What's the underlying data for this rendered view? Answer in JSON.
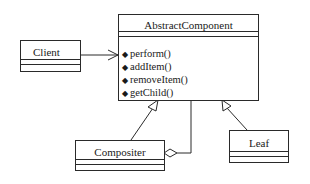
{
  "diagram": {
    "type": "UML class diagram (Composite pattern)",
    "classes": {
      "abstract_component": {
        "name": "AbstractComponent",
        "attributes": [],
        "operations": [
          {
            "bullet": "◆",
            "label": "perform()"
          },
          {
            "bullet": "◆",
            "label": "addItem()"
          },
          {
            "bullet": "◆",
            "label": "removeItem()"
          },
          {
            "bullet": "◆",
            "label": "getChild()"
          }
        ]
      },
      "client": {
        "name": "Client",
        "attributes": [],
        "operations": []
      },
      "compositer": {
        "name": "Compositer",
        "attributes": [],
        "operations": []
      },
      "leaf": {
        "name": "Leaf",
        "attributes": [],
        "operations": []
      }
    },
    "relationships": [
      {
        "from": "Client",
        "to": "AbstractComponent",
        "kind": "association",
        "end": "open-arrow"
      },
      {
        "from": "Compositer",
        "to": "AbstractComponent",
        "kind": "generalization",
        "end": "hollow-triangle"
      },
      {
        "from": "Leaf",
        "to": "AbstractComponent",
        "kind": "generalization",
        "end": "hollow-triangle"
      },
      {
        "from": "Compositer",
        "to": "AbstractComponent",
        "kind": "aggregation",
        "end": "hollow-diamond-at-Compositer"
      }
    ],
    "colors": {
      "line": "#2a2a2a",
      "background": "#ffffff"
    }
  }
}
